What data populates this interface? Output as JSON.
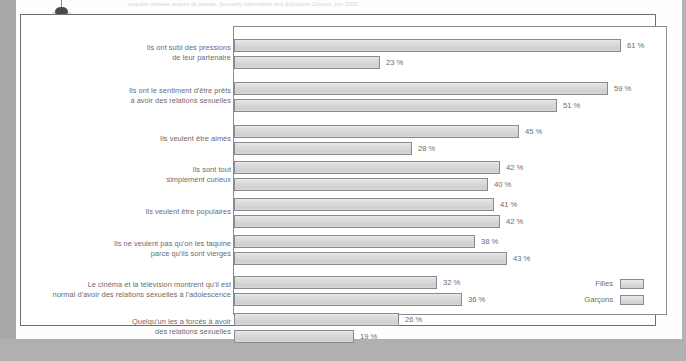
{
  "figure": {
    "caption_fragment": "enquête réalisée auprès de jeunes, Sexuality Information and Education Council, juin 2000",
    "pin_icon": "thumbtack-icon"
  },
  "legend": {
    "position": "bottom-right",
    "entries": [
      {
        "label": "Filles",
        "swatch": "#dedede"
      },
      {
        "label": "Garçons",
        "swatch": "#d8d8d8"
      }
    ]
  },
  "chart_data": {
    "type": "bar",
    "orientation": "horizontal",
    "title": "",
    "subtitle": "",
    "xlabel": "",
    "ylabel": "",
    "xlim": [
      0,
      68
    ],
    "grid": false,
    "value_suffix": "%",
    "categories": [
      "Ils ont subi des pressions\nde leur partenaire",
      "Ils ont le sentiment d'être prêts\nà avoir des relations sexuelles",
      "Ils veulent être aimés",
      "Ils sont tout\nsimplement curieux",
      "Ils veulent être populaires",
      "Ils ne veulent pas qu'on les taquine\nparce qu'ils sont vierges",
      "Le cinéma et la télévision montrent qu'il est\nnormal d'avoir des relations sexuelles à l'adolescence",
      "Quelqu'un les a forcés à avoir\ndes relations sexuelles"
    ],
    "series": [
      {
        "name": "Filles",
        "values": [
          61,
          59,
          45,
          42,
          41,
          38,
          32,
          26
        ],
        "labels": [
          "61 %",
          "59 %",
          "45 %",
          "42 %",
          "41 %",
          "38 %",
          "32 %",
          "26 %"
        ]
      },
      {
        "name": "Garçons",
        "values": [
          23,
          51,
          28,
          40,
          42,
          43,
          36,
          19
        ],
        "labels": [
          "23 %",
          "51 %",
          "28 %",
          "40 %",
          "42 %",
          "43 %",
          "36 %",
          "19 %"
        ]
      }
    ]
  }
}
